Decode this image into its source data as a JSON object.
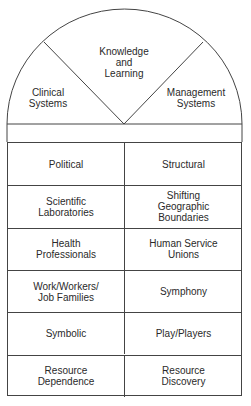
{
  "arch": {
    "segments": [
      {
        "label": "Clinical\nSystems"
      },
      {
        "label": "Knowledge\nand\nLearning"
      },
      {
        "label": "Management\nSystems"
      }
    ]
  },
  "grid": {
    "rows": [
      {
        "left": "Political",
        "right": "Structural"
      },
      {
        "left": "Scientific\nLaboratories",
        "right": "Shifting\nGeographic\nBoundaries"
      },
      {
        "left": "Health\nProfessionals",
        "right": "Human Service\nUnions"
      },
      {
        "left": "Work/Workers/\nJob Families",
        "right": "Symphony"
      },
      {
        "left": "Symbolic",
        "right": "Play/Players"
      },
      {
        "left": "Resource\nDependence",
        "right": "Resource\nDiscovery"
      }
    ]
  },
  "colors": {
    "line": "#444444",
    "text": "#2a2a2a",
    "background": "#ffffff"
  }
}
